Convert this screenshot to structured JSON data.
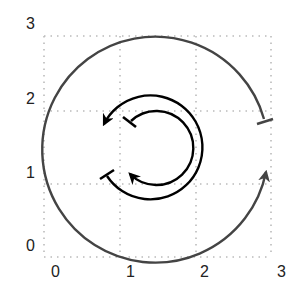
{
  "diagram": {
    "x_ticks": [
      "0",
      "1",
      "2",
      "3"
    ],
    "y_ticks": [
      "0",
      "1",
      "2",
      "3"
    ],
    "grid": {
      "style": "dotted",
      "color": "#bbbbbb",
      "range": [
        0,
        3
      ]
    },
    "arcs": [
      {
        "name": "outer-arc",
        "color": "#444444",
        "direction": "counterclockwise",
        "start": "T-bar",
        "end": "arrow",
        "center": [
          1.49,
          1.48
        ],
        "radius": 1.48
      },
      {
        "name": "middle-arc",
        "color": "#000000",
        "direction": "counterclockwise",
        "start": "T-bar",
        "end": "arrow",
        "center": [
          1.4,
          1.48
        ],
        "radius": 0.69
      },
      {
        "name": "inner-arc",
        "color": "#000000",
        "direction": "clockwise",
        "start": "T-bar",
        "end": "arrow",
        "center": [
          1.46,
          1.47
        ],
        "radius": 0.49
      }
    ]
  }
}
